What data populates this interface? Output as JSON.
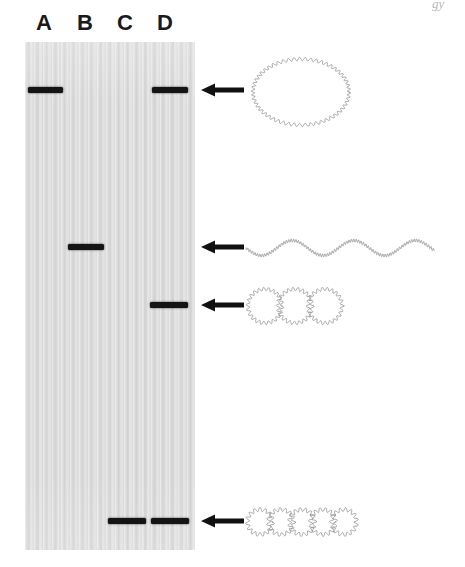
{
  "figure": {
    "type": "gel-electrophoresis-schematic",
    "edge_artifact_text": "gy"
  },
  "gel": {
    "x": 25,
    "y": 42,
    "width": 170,
    "height": 508,
    "background_color": "#dcdcdc",
    "band_color": "#141414",
    "lanes": [
      {
        "id": "A",
        "label": "A",
        "label_center_x": 44,
        "lane_center_x": 45
      },
      {
        "id": "B",
        "label": "B",
        "label_center_x": 85,
        "lane_center_x": 86
      },
      {
        "id": "C",
        "label": "C",
        "label_center_x": 125,
        "lane_center_x": 126
      },
      {
        "id": "D",
        "label": "D",
        "label_center_x": 165,
        "lane_center_x": 167
      }
    ],
    "label_y": 12,
    "bands": [
      {
        "lane": "A",
        "row": 1,
        "x": 28,
        "y": 87,
        "width": 35,
        "height": 6
      },
      {
        "lane": "D",
        "row": 1,
        "x": 152,
        "y": 87,
        "width": 36,
        "height": 6
      },
      {
        "lane": "B",
        "row": 2,
        "x": 68,
        "y": 244,
        "width": 36,
        "height": 6
      },
      {
        "lane": "D",
        "row": 3,
        "x": 150,
        "y": 302,
        "width": 38,
        "height": 6
      },
      {
        "lane": "C",
        "row": 4,
        "x": 108,
        "y": 518,
        "width": 38,
        "height": 6
      },
      {
        "lane": "D",
        "row": 4,
        "x": 151,
        "y": 518,
        "width": 38,
        "height": 6
      }
    ]
  },
  "arrows": [
    {
      "id": "arrow-monomer-circle",
      "points_to": "row-1-bands",
      "x1": 243,
      "x2": 201,
      "y": 90
    },
    {
      "id": "arrow-linear",
      "points_to": "row-2-band",
      "x1": 243,
      "x2": 201,
      "y": 247
    },
    {
      "id": "arrow-trimer",
      "points_to": "row-3-band",
      "x1": 243,
      "x2": 201,
      "y": 305
    },
    {
      "id": "arrow-pentamer",
      "points_to": "row-4-bands",
      "x1": 243,
      "x2": 201,
      "y": 521
    }
  ],
  "dna_forms": [
    {
      "id": "circular-monomer",
      "name": "circular-dna-monomer",
      "shape": "single large wavy circle",
      "circles": 1,
      "x": 245,
      "y": 52,
      "width": 110,
      "height": 78
    },
    {
      "id": "linear-dna",
      "name": "linear-dna-strand",
      "shape": "wavy linear strand",
      "wave_periods": 3,
      "x": 245,
      "y": 228,
      "width": 192,
      "height": 38
    },
    {
      "id": "catenated-trimer",
      "name": "catenated-dna-trimer",
      "shape": "three interlocked wavy circles",
      "circles": 3,
      "x": 245,
      "y": 288,
      "width": 96,
      "height": 36
    },
    {
      "id": "catenated-pentamer",
      "name": "catenated-dna-pentamer",
      "shape": "five interlocked wavy circles",
      "circles": 5,
      "x": 245,
      "y": 505,
      "width": 105,
      "height": 32
    }
  ]
}
